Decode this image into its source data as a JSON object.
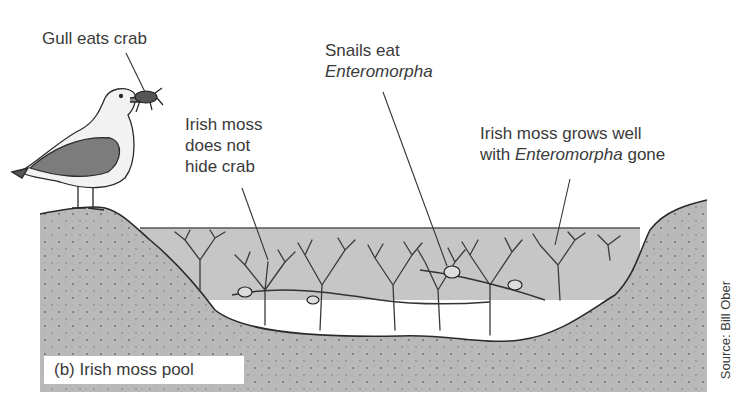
{
  "figure": {
    "panel_label": "(b) Irish moss pool",
    "source": "Source: Bill Ober"
  },
  "annotations": {
    "gull": {
      "text": "Gull eats crab"
    },
    "snails": {
      "line1": "Snails eat",
      "line2_italic": "Enteromorpha"
    },
    "hide": {
      "line1": "Irish moss",
      "line2": "does not",
      "line3": "hide crab"
    },
    "grows": {
      "line1": "Irish moss grows well",
      "line2_prefix": "with ",
      "line2_italic": "Enteromorpha",
      "line2_suffix": " gone"
    }
  },
  "elements": {
    "gull": "herring gull standing on left rock holding crab in beak",
    "crab": "crab in gull's beak",
    "irish_moss": "branching Irish moss seaweed filling tide pool",
    "snails": "snails grazing on strands in pool",
    "pool": "tide pool water between rocks",
    "rock": "stippled gray rock substrate"
  },
  "colors": {
    "rock": "#b9b9b9",
    "water": "#c6c6c6",
    "outline": "#2a2a2a",
    "wing": "#7c7c7c",
    "text": "#3a3a3a"
  }
}
